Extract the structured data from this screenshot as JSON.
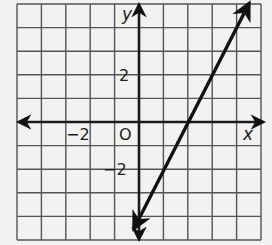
{
  "chart_data": {
    "type": "line",
    "title": "",
    "xlabel": "x",
    "ylabel": "y",
    "origin_label": "O",
    "xlim": [
      -5,
      5
    ],
    "ylim": [
      -5,
      5
    ],
    "grid": true,
    "grid_step": 1,
    "x_tick_labels": [
      {
        "value": -2,
        "label": "−2"
      }
    ],
    "y_tick_labels": [
      {
        "value": 2,
        "label": "2"
      },
      {
        "value": -2,
        "label": "−2"
      }
    ],
    "series": [
      {
        "name": "line",
        "equation": "y = 2x - 4",
        "slope": 2,
        "y_intercept": -4,
        "x_intercept": 2,
        "x": [
          -0.2,
          4.5
        ],
        "y": [
          -4.5,
          5
        ],
        "arrows": "both"
      }
    ],
    "colors": {
      "grid": "#555555",
      "axes": "#1a1a1a",
      "line": "#111111",
      "background": "#f2f2f0"
    }
  }
}
